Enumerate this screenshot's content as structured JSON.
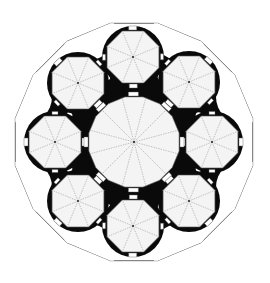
{
  "diagram": {
    "type": "architectural-floor-plan",
    "colors": {
      "background": "#ffffff",
      "wall": "#0a0a0a",
      "room_fill": "#f4f4f4",
      "line": "#8a8a8a",
      "outer_edge": "#444444"
    },
    "center": [
      134,
      142
    ],
    "outer_polygon": {
      "sides": 16,
      "radius": 121
    },
    "central_rotunda": {
      "shape": "16-gon",
      "radius": 46,
      "radial_lines": 12
    },
    "chapels": [
      {
        "name": "top",
        "center": [
          133,
          57
        ]
      },
      {
        "name": "upper-right",
        "center": [
          189,
          82
        ]
      },
      {
        "name": "right",
        "center": [
          212,
          142
        ]
      },
      {
        "name": "lower-right",
        "center": [
          189,
          201
        ]
      },
      {
        "name": "bottom",
        "center": [
          133,
          226
        ]
      },
      {
        "name": "lower-left",
        "center": [
          78,
          201
        ]
      },
      {
        "name": "left",
        "center": [
          55,
          142
        ]
      },
      {
        "name": "upper-left",
        "center": [
          78,
          83
        ]
      }
    ],
    "chapel_shape": {
      "sides": 8,
      "radius": 28,
      "radial_lines": 8
    }
  }
}
